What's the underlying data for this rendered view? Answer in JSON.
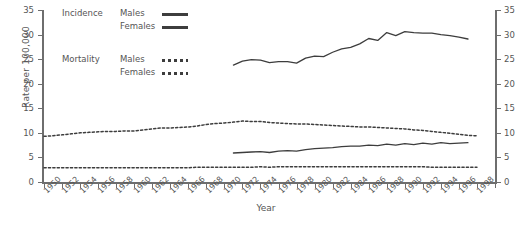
{
  "chart_data": {
    "type": "line",
    "title": "",
    "xlabel": "Year",
    "ylabel": "Rate per 100,000",
    "xlim": [
      1950,
      2000
    ],
    "ylim": [
      0,
      35
    ],
    "yticks": [
      0,
      5,
      10,
      15,
      20,
      25,
      30,
      35
    ],
    "xticks": [
      1950,
      1952,
      1954,
      1956,
      1958,
      1960,
      1962,
      1964,
      1966,
      1968,
      1970,
      1972,
      1974,
      1976,
      1978,
      1980,
      1982,
      1984,
      1986,
      1988,
      1990,
      1992,
      1994,
      1996,
      1998
    ],
    "grid": false,
    "dual_y_axis": true,
    "legend": {
      "position": "top-left",
      "groups": [
        {
          "group": "Incidence",
          "entries": [
            {
              "label": "Males",
              "style": "solid"
            },
            {
              "label": "Females",
              "style": "solid"
            }
          ]
        },
        {
          "group": "Mortality",
          "entries": [
            {
              "label": "Males",
              "style": "dotted"
            },
            {
              "label": "Females",
              "style": "dotted"
            }
          ]
        }
      ]
    },
    "series": [
      {
        "name": "Incidence Males",
        "style": "solid",
        "color": "#3d3d3d",
        "x": [
          1971,
          1972,
          1973,
          1974,
          1975,
          1976,
          1977,
          1978,
          1979,
          1980,
          1981,
          1982,
          1983,
          1984,
          1985,
          1986,
          1987,
          1988,
          1989,
          1990,
          1991,
          1992,
          1993,
          1994,
          1995,
          1996,
          1997
        ],
        "y": [
          23.8,
          24.6,
          24.9,
          24.8,
          24.3,
          24.5,
          24.5,
          24.2,
          25.2,
          25.6,
          25.5,
          26.4,
          27.1,
          27.4,
          28.1,
          29.2,
          28.8,
          30.4,
          29.8,
          30.6,
          30.4,
          30.3,
          30.3,
          30.0,
          29.8,
          29.5,
          29.1
        ]
      },
      {
        "name": "Incidence Females",
        "style": "solid",
        "color": "#3d3d3d",
        "x": [
          1971,
          1972,
          1973,
          1974,
          1975,
          1976,
          1977,
          1978,
          1979,
          1980,
          1981,
          1982,
          1983,
          1984,
          1985,
          1986,
          1987,
          1988,
          1989,
          1990,
          1991,
          1992,
          1993,
          1994,
          1995,
          1996,
          1997
        ],
        "y": [
          5.9,
          6.0,
          6.1,
          6.2,
          6.0,
          6.3,
          6.4,
          6.3,
          6.6,
          6.8,
          6.9,
          7.0,
          7.2,
          7.3,
          7.3,
          7.5,
          7.4,
          7.7,
          7.5,
          7.8,
          7.6,
          7.9,
          7.7,
          8.0,
          7.8,
          7.9,
          8.0
        ]
      },
      {
        "name": "Mortality Males",
        "style": "dotted",
        "color": "#3d3d3d",
        "x": [
          1950,
          1951,
          1952,
          1953,
          1954,
          1955,
          1956,
          1957,
          1958,
          1959,
          1960,
          1961,
          1962,
          1963,
          1964,
          1965,
          1966,
          1967,
          1968,
          1969,
          1970,
          1971,
          1972,
          1973,
          1974,
          1975,
          1976,
          1977,
          1978,
          1979,
          1980,
          1981,
          1982,
          1983,
          1984,
          1985,
          1986,
          1987,
          1988,
          1989,
          1990,
          1991,
          1992,
          1993,
          1994,
          1995,
          1996,
          1997,
          1998
        ],
        "y": [
          9.3,
          9.4,
          9.6,
          9.8,
          10.0,
          10.1,
          10.2,
          10.3,
          10.3,
          10.4,
          10.4,
          10.6,
          10.8,
          11.0,
          11.0,
          11.1,
          11.2,
          11.4,
          11.7,
          11.9,
          12.0,
          12.2,
          12.4,
          12.3,
          12.3,
          12.1,
          12.0,
          11.9,
          11.8,
          11.8,
          11.7,
          11.6,
          11.5,
          11.4,
          11.3,
          11.2,
          11.2,
          11.1,
          11.0,
          10.9,
          10.8,
          10.6,
          10.5,
          10.3,
          10.1,
          9.9,
          9.7,
          9.5,
          9.4
        ]
      },
      {
        "name": "Mortality Females",
        "style": "dotted",
        "color": "#3d3d3d",
        "x": [
          1950,
          1951,
          1952,
          1953,
          1954,
          1955,
          1956,
          1957,
          1958,
          1959,
          1960,
          1961,
          1962,
          1963,
          1964,
          1965,
          1966,
          1967,
          1968,
          1969,
          1970,
          1971,
          1972,
          1973,
          1974,
          1975,
          1976,
          1977,
          1978,
          1979,
          1980,
          1981,
          1982,
          1983,
          1984,
          1985,
          1986,
          1987,
          1988,
          1989,
          1990,
          1991,
          1992,
          1993,
          1994,
          1995,
          1996,
          1997,
          1998
        ],
        "y": [
          2.9,
          2.9,
          2.9,
          2.9,
          2.9,
          2.9,
          2.9,
          2.9,
          2.9,
          2.9,
          2.9,
          2.9,
          2.9,
          2.9,
          2.9,
          2.9,
          2.9,
          3.0,
          3.0,
          3.0,
          3.0,
          3.0,
          3.0,
          3.0,
          3.1,
          3.0,
          3.1,
          3.1,
          3.1,
          3.1,
          3.1,
          3.1,
          3.1,
          3.1,
          3.1,
          3.1,
          3.1,
          3.1,
          3.1,
          3.1,
          3.1,
          3.1,
          3.1,
          3.0,
          3.0,
          3.0,
          3.0,
          3.0,
          3.0
        ]
      }
    ]
  }
}
